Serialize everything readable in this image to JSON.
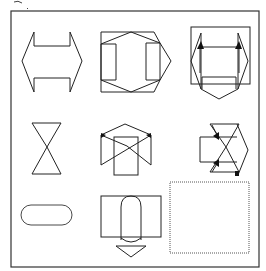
{
  "figure": {
    "title": "",
    "grid_rows": 3,
    "grid_cols": 3,
    "colors": {
      "stroke": "#222222",
      "background": "#ffffff",
      "placeholder_border": "#555555"
    },
    "cells": [
      {
        "row": 1,
        "col": 1,
        "shape": "double-headed-horizontal-arrow",
        "label": ""
      },
      {
        "row": 1,
        "col": 2,
        "shape": "square-with-hexagon-and-inner-brackets",
        "label": ""
      },
      {
        "row": 1,
        "col": 3,
        "shape": "pentagon-box-with-arrows",
        "label": ""
      },
      {
        "row": 2,
        "col": 1,
        "shape": "hourglass",
        "label": ""
      },
      {
        "row": 2,
        "col": 2,
        "shape": "house-with-cross",
        "label": ""
      },
      {
        "row": 2,
        "col": 3,
        "shape": "hexagon-bowtie-with-arrows",
        "label": ""
      },
      {
        "row": 3,
        "col": 1,
        "shape": "rounded-pill",
        "label": ""
      },
      {
        "row": 3,
        "col": 2,
        "shape": "rectangle-with-capsule-and-down-arrow",
        "label": ""
      },
      {
        "row": 3,
        "col": 3,
        "shape": "empty-answer-box",
        "label": ""
      }
    ]
  }
}
